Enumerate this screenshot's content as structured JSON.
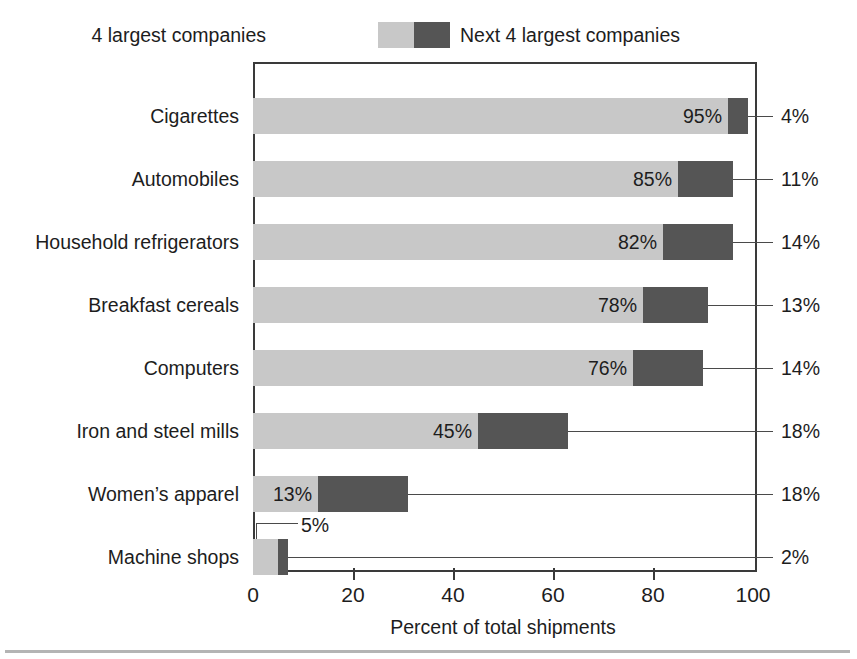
{
  "legend": {
    "left_label": "4 largest companies",
    "right_label": "Next 4 largest companies",
    "light_swatch_name": "light-gray-swatch",
    "dark_swatch_name": "dark-gray-swatch"
  },
  "axis": {
    "title": "Percent of total shipments",
    "ticks": [
      "0",
      "20",
      "40",
      "60",
      "80",
      "100"
    ]
  },
  "colors": {
    "light": "#c8c8c8",
    "dark": "#555555",
    "frame": "#3a3a3a",
    "text": "#1d1d1d"
  },
  "chart_data": {
    "type": "bar",
    "orientation": "horizontal",
    "stacked": true,
    "title": "",
    "xlabel": "Percent of total shipments",
    "ylabel": "",
    "xlim": [
      0,
      100
    ],
    "xticks": [
      0,
      20,
      40,
      60,
      80,
      100
    ],
    "grid": false,
    "legend_position": "top",
    "categories": [
      "Cigarettes",
      "Automobiles",
      "Household refrigerators",
      "Breakfast cereals",
      "Computers",
      "Iron and steel mills",
      "Women’s apparel",
      "Machine shops"
    ],
    "series": [
      {
        "name": "4 largest companies",
        "color": "#c8c8c8",
        "values": [
          95,
          85,
          82,
          78,
          76,
          45,
          13,
          5
        ],
        "labels": [
          "95%",
          "85%",
          "82%",
          "78%",
          "76%",
          "45%",
          "13%",
          "5%"
        ]
      },
      {
        "name": "Next 4 largest companies",
        "color": "#555555",
        "values": [
          4,
          11,
          14,
          13,
          14,
          18,
          18,
          2
        ],
        "labels": [
          "4%",
          "11%",
          "14%",
          "13%",
          "14%",
          "18%",
          "18%",
          "2%"
        ]
      }
    ]
  },
  "rows": [
    {
      "category": "Cigarettes",
      "light": 95,
      "dark": 4,
      "light_label": "95%",
      "dark_label": "4%"
    },
    {
      "category": "Automobiles",
      "light": 85,
      "dark": 11,
      "light_label": "85%",
      "dark_label": "11%"
    },
    {
      "category": "Household refrigerators",
      "light": 82,
      "dark": 14,
      "light_label": "82%",
      "dark_label": "14%"
    },
    {
      "category": "Breakfast cereals",
      "light": 78,
      "dark": 13,
      "light_label": "78%",
      "dark_label": "13%"
    },
    {
      "category": "Computers",
      "light": 76,
      "dark": 14,
      "light_label": "76%",
      "dark_label": "14%"
    },
    {
      "category": "Iron and steel mills",
      "light": 45,
      "dark": 18,
      "light_label": "45%",
      "dark_label": "18%"
    },
    {
      "category": "Women’s apparel",
      "light": 13,
      "dark": 18,
      "light_label": "13%",
      "dark_label": "18%"
    },
    {
      "category": "Machine shops",
      "light": 5,
      "dark": 2,
      "light_label": "5%",
      "dark_label": "2%"
    }
  ]
}
